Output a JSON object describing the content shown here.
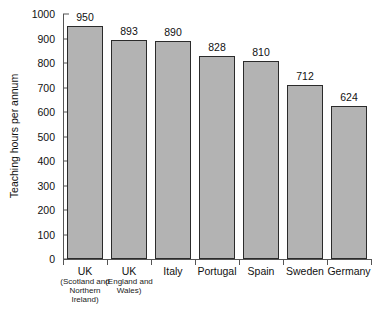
{
  "chart_data": {
    "type": "bar",
    "title": "",
    "xlabel": "",
    "ylabel": "Teaching hours per annum",
    "ylim": [
      0,
      1000
    ],
    "ytick_step": 100,
    "grid": false,
    "legend": null,
    "categories": [
      "UK (Scotland and Northern Ireland)",
      "UK (England and Wales)",
      "Italy",
      "Portugal",
      "Spain",
      "Sweden",
      "Germany"
    ],
    "category_labels": [
      {
        "main": "UK",
        "sub": "(Scotland and Northern Ireland)"
      },
      {
        "main": "UK",
        "sub": "(England and Wales)"
      },
      {
        "main": "Italy",
        "sub": ""
      },
      {
        "main": "Portugal",
        "sub": ""
      },
      {
        "main": "Spain",
        "sub": ""
      },
      {
        "main": "Sweden",
        "sub": ""
      },
      {
        "main": "Germany",
        "sub": ""
      }
    ],
    "values": [
      950,
      893,
      890,
      828,
      810,
      712,
      624
    ],
    "value_labels": [
      "950",
      "893",
      "890",
      "828",
      "810",
      "712",
      "624"
    ],
    "ytick_labels": [
      "0",
      "100",
      "200",
      "300",
      "400",
      "500",
      "600",
      "700",
      "800",
      "900",
      "1000"
    ],
    "ytick_values": [
      0,
      100,
      200,
      300,
      400,
      500,
      600,
      700,
      800,
      900,
      1000
    ],
    "colors": {
      "bar_fill": "#b3b3b3",
      "bar_edge": "#2b2b2b",
      "axis": "#555555",
      "text": "#111111",
      "background": "#ffffff"
    }
  }
}
